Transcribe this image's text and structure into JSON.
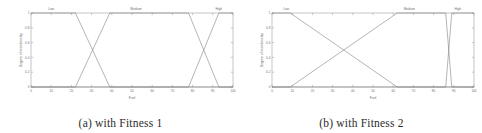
{
  "figure": {
    "panels": [
      {
        "caption": "(a) with Fitness 1",
        "chart_data": {
          "type": "line",
          "title": "",
          "xlabel": "Fuel",
          "ylabel": "Degree of membership",
          "xlim": [
            0,
            100
          ],
          "ylim": [
            0,
            1
          ],
          "xticks": [
            0,
            10,
            20,
            30,
            40,
            50,
            60,
            70,
            80,
            90,
            100
          ],
          "xtick_labels": [
            "0",
            "10",
            "20",
            "30",
            "40",
            "50",
            "60",
            "70",
            "80",
            "90",
            "100"
          ],
          "yticks": [
            0,
            0.2,
            0.4,
            0.6,
            0.8,
            1
          ],
          "ytick_labels": [
            "0",
            "0.2",
            "0.4",
            "0.6",
            "0.8",
            "1"
          ],
          "grid": false,
          "legend": "none",
          "annotations": [
            {
              "text": "Low",
              "x": 10,
              "y": 1.06
            },
            {
              "text": "Medium",
              "x": 52,
              "y": 1.06
            },
            {
              "text": "High",
              "x": 93,
              "y": 1.06
            }
          ],
          "series": [
            {
              "name": "Low",
              "x": [
                0,
                22,
                39,
                100
              ],
              "values": [
                1,
                1,
                0,
                0
              ]
            },
            {
              "name": "Medium",
              "x": [
                0,
                22,
                39,
                78,
                93,
                100
              ],
              "values": [
                0,
                0,
                1,
                1,
                0,
                0
              ]
            },
            {
              "name": "High",
              "x": [
                0,
                78,
                93,
                100
              ],
              "values": [
                0,
                0,
                1,
                1
              ]
            }
          ]
        }
      },
      {
        "caption": "(b) with Fitness 2",
        "chart_data": {
          "type": "line",
          "title": "",
          "xlabel": "Fuel",
          "ylabel": "Degree of membership",
          "xlim": [
            0,
            100
          ],
          "ylim": [
            0,
            1
          ],
          "xticks": [
            0,
            10,
            20,
            30,
            40,
            50,
            60,
            70,
            80,
            90,
            100
          ],
          "xtick_labels": [
            "0",
            "10",
            "20",
            "30",
            "40",
            "50",
            "60",
            "70",
            "80",
            "90",
            "100"
          ],
          "yticks": [
            0,
            0.2,
            0.4,
            0.6,
            0.8,
            1
          ],
          "ytick_labels": [
            "0",
            "0.2",
            "0.4",
            "0.6",
            "0.8",
            "1"
          ],
          "grid": false,
          "legend": "none",
          "annotations": [
            {
              "text": "Low",
              "x": 7,
              "y": 1.06
            },
            {
              "text": "Medium",
              "x": 68,
              "y": 1.06
            },
            {
              "text": "High",
              "x": 92,
              "y": 1.06
            }
          ],
          "series": [
            {
              "name": "Low",
              "x": [
                0,
                9,
                62,
                100
              ],
              "values": [
                1,
                1,
                0,
                0
              ]
            },
            {
              "name": "Medium",
              "x": [
                0,
                9,
                62,
                86,
                89,
                100
              ],
              "values": [
                0,
                0,
                1,
                1,
                0,
                0
              ]
            },
            {
              "name": "High",
              "x": [
                0,
                86,
                89,
                100
              ],
              "values": [
                0,
                0,
                1,
                1
              ]
            }
          ]
        }
      }
    ]
  }
}
